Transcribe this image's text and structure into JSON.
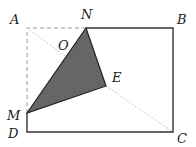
{
  "diagram": {
    "type": "geometry-fold",
    "colors": {
      "solid_line": "#333333",
      "dashed_line": "#999999",
      "dotted_line": "#bbbbbb",
      "shaded_fill": "#666666",
      "label": "#222222"
    },
    "points": {
      "A": {
        "label": "A",
        "x": 27,
        "y": 28,
        "lx": 10,
        "ly": 24
      },
      "N": {
        "label": "N",
        "x": 86,
        "y": 28,
        "lx": 81,
        "ly": 19
      },
      "B": {
        "label": "B",
        "x": 173,
        "y": 28,
        "lx": 177,
        "ly": 24
      },
      "C": {
        "label": "C",
        "x": 173,
        "y": 132,
        "lx": 177,
        "ly": 143
      },
      "D": {
        "label": "D",
        "x": 27,
        "y": 132,
        "lx": 8,
        "ly": 138
      },
      "M": {
        "label": "M",
        "x": 27,
        "y": 113,
        "lx": 7,
        "ly": 120
      },
      "E": {
        "label": "E",
        "x": 106,
        "y": 86,
        "lx": 112,
        "ly": 82
      },
      "O": {
        "label": "O",
        "x": 70,
        "y": 45,
        "lx": 58,
        "ly": 50
      }
    },
    "segments_solid": [
      [
        "N",
        "B"
      ],
      [
        "B",
        "C"
      ],
      [
        "C",
        "D"
      ],
      [
        "D",
        "M"
      ]
    ],
    "segments_dashed": [
      [
        "M",
        "A"
      ],
      [
        "A",
        "N"
      ]
    ],
    "segments_dotted": [
      [
        "A",
        "E"
      ],
      [
        "E",
        "C"
      ]
    ],
    "shaded_polygon": [
      "M",
      "N",
      "E"
    ]
  }
}
